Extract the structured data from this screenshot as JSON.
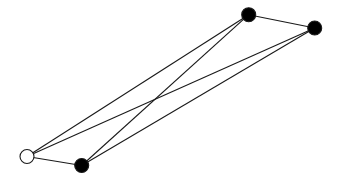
{
  "diagram": {
    "type": "graph",
    "colors": {
      "edge": "#1a1a1a",
      "filled_node": "#000000",
      "unfilled_node": "#ffffff"
    },
    "nodes": [
      {
        "id": "a",
        "filled": false
      },
      {
        "id": "b",
        "filled": true
      },
      {
        "id": "c",
        "filled": true
      },
      {
        "id": "d",
        "filled": true
      }
    ],
    "edges": [
      [
        "a",
        "b"
      ],
      [
        "a",
        "c"
      ],
      [
        "a",
        "d"
      ],
      [
        "b",
        "c"
      ],
      [
        "b",
        "d"
      ],
      [
        "c",
        "d"
      ]
    ]
  }
}
